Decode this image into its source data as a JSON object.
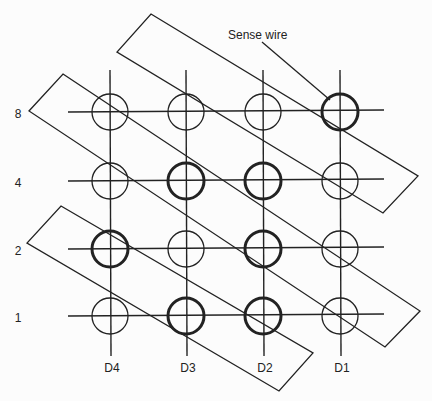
{
  "diagram": {
    "annotation": {
      "label": "Sense wire",
      "x": 228,
      "y": 29
    },
    "rows": [
      {
        "label": "8",
        "y": 112
      },
      {
        "label": "4",
        "y": 181
      },
      {
        "label": "2",
        "y": 249
      },
      {
        "label": "1",
        "y": 316
      }
    ],
    "columns": [
      {
        "label": "D4",
        "x": 110
      },
      {
        "label": "D3",
        "x": 186
      },
      {
        "label": "D2",
        "x": 263
      },
      {
        "label": "D1",
        "x": 340
      }
    ],
    "core_states": [
      [
        0,
        0,
        0,
        1
      ],
      [
        0,
        1,
        1,
        0
      ],
      [
        1,
        0,
        1,
        0
      ],
      [
        0,
        1,
        1,
        0
      ]
    ],
    "rectangles": [
      [
        [
          151,
          14
        ],
        [
          418,
          176
        ],
        [
          383,
          213
        ],
        [
          117,
          52
        ]
      ],
      [
        [
          63,
          74
        ],
        [
          420,
          311
        ],
        [
          385,
          347
        ],
        [
          29,
          111
        ]
      ],
      [
        [
          61,
          206
        ],
        [
          313,
          353
        ],
        [
          279,
          391
        ],
        [
          27,
          243
        ]
      ]
    ],
    "sense_leader": [
      [
        262,
        42
      ],
      [
        330,
        100
      ]
    ],
    "colors": {
      "line": "#222222",
      "background": "#fcfcfc"
    }
  }
}
